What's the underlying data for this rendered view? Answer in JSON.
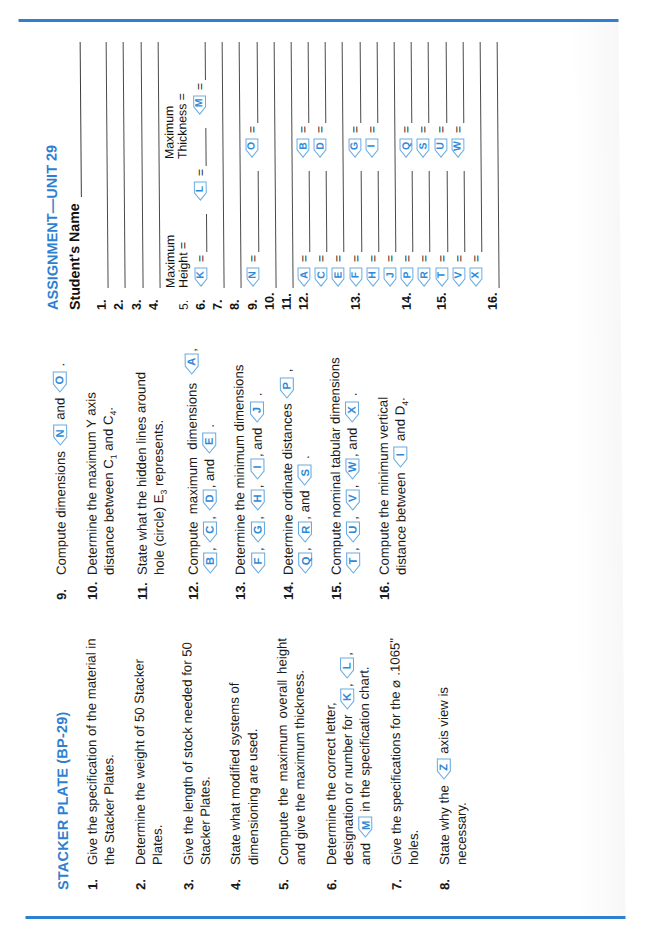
{
  "page": {
    "accent_color": "#2f7fd1",
    "balloon_color": "#2f8ad6",
    "section_title": "STACKER PLATE (BP-29)",
    "assignment_title": "ASSIGNMENT—UNIT 29",
    "student_name_label": "Student's Name"
  },
  "questions": [
    {
      "num": "1.",
      "text_parts": [
        {
          "t": "Give the specification of the material in the Stacker Plates."
        }
      ]
    },
    {
      "num": "2.",
      "text_parts": [
        {
          "t": "Determine the weight of 50 Stacker Plates."
        }
      ]
    },
    {
      "num": "3.",
      "text_parts": [
        {
          "t": "Give the length of stock needed for 50 Stacker Plates."
        }
      ]
    },
    {
      "num": "4.",
      "text_parts": [
        {
          "t": "State what modified systems of dimensioning are used."
        }
      ]
    },
    {
      "num": "5.",
      "text_parts": [
        {
          "t": "Compute the maximum overall height and give the maximum thickness."
        }
      ]
    },
    {
      "num": "6.",
      "text_parts": [
        {
          "t": "Determine the correct letter, designation or number for "
        },
        {
          "b": "K"
        },
        {
          "t": ", "
        },
        {
          "b": "L"
        },
        {
          "t": ", and "
        },
        {
          "b": "M"
        },
        {
          "t": " in the specification chart."
        }
      ]
    },
    {
      "num": "7.",
      "text_parts": [
        {
          "t": "Give the specifications for the ⌀ .1065\" holes."
        }
      ]
    },
    {
      "num": "8.",
      "text_parts": [
        {
          "t": "State why the "
        },
        {
          "b": "Z"
        },
        {
          "t": " axis view is necessary."
        }
      ]
    },
    {
      "num": "9.",
      "text_parts": [
        {
          "t": "Compute dimensions "
        },
        {
          "b": "N"
        },
        {
          "t": " and "
        },
        {
          "b": "O"
        },
        {
          "t": " ."
        }
      ]
    },
    {
      "num": "10.",
      "text_parts": [
        {
          "t": "Determine the maximum Y axis distance between C"
        },
        {
          "sub": "1"
        },
        {
          "t": " and C"
        },
        {
          "sub": "4"
        },
        {
          "t": "."
        }
      ]
    },
    {
      "num": "11.",
      "text_parts": [
        {
          "t": "State what the hidden lines around hole (circle) E"
        },
        {
          "sub": "3"
        },
        {
          "t": " represents."
        }
      ]
    },
    {
      "num": "12.",
      "text_parts": [
        {
          "t": "Compute maximum dimensions "
        },
        {
          "b": "A"
        },
        {
          "t": ", "
        },
        {
          "b": "B"
        },
        {
          "t": ", "
        },
        {
          "b": "C"
        },
        {
          "t": ", "
        },
        {
          "b": "D"
        },
        {
          "t": ", and "
        },
        {
          "b": "E"
        },
        {
          "t": " ."
        }
      ]
    },
    {
      "num": "13.",
      "text_parts": [
        {
          "t": "Determine the minimum dimensions "
        },
        {
          "b": "F"
        },
        {
          "t": ", "
        },
        {
          "b": "G"
        },
        {
          "t": ", "
        },
        {
          "b": "H"
        },
        {
          "t": ", "
        },
        {
          "b": "I"
        },
        {
          "t": ", and "
        },
        {
          "b": "J"
        },
        {
          "t": " ."
        }
      ]
    },
    {
      "num": "14.",
      "text_parts": [
        {
          "t": "Determine ordinate distances "
        },
        {
          "b": "P"
        },
        {
          "t": " , "
        },
        {
          "b": "Q"
        },
        {
          "t": ", "
        },
        {
          "b": "R"
        },
        {
          "t": ", and "
        },
        {
          "b": "S"
        },
        {
          "t": " ."
        }
      ]
    },
    {
      "num": "15.",
      "text_parts": [
        {
          "t": "Compute nominal tabular dimensions "
        },
        {
          "b": "T"
        },
        {
          "t": ", "
        },
        {
          "b": "U"
        },
        {
          "t": ", "
        },
        {
          "b": "V"
        },
        {
          "t": ", "
        },
        {
          "b": "W"
        },
        {
          "t": ", and "
        },
        {
          "b": "X"
        },
        {
          "t": " ."
        }
      ]
    },
    {
      "num": "16.",
      "text_parts": [
        {
          "t": "Compute the minimum vertical distance between "
        },
        {
          "b": "I"
        },
        {
          "t": " and D"
        },
        {
          "sub": "4"
        },
        {
          "t": "."
        }
      ]
    }
  ],
  "answer_sheet": {
    "title": "ASSIGNMENT—UNIT 29",
    "name_label": "Student's Name",
    "header_5": {
      "left": "Maximum\nHeight =",
      "right": "Maximum\nThickness ="
    },
    "rows": [
      {
        "num": "1.",
        "cells": [
          {
            "type": "line"
          }
        ]
      },
      {
        "num": "2.",
        "cells": [
          {
            "type": "line"
          }
        ]
      },
      {
        "num": "3.",
        "cells": [
          {
            "type": "line"
          }
        ]
      },
      {
        "num": "4.",
        "cells": [
          {
            "type": "line"
          }
        ]
      },
      {
        "num": "5.",
        "cells": [
          {
            "type": "header-height"
          },
          {
            "type": "header-thickness"
          }
        ]
      },
      {
        "num": "6.",
        "cells": [
          {
            "type": "balloon",
            "label": "K",
            "eq": "="
          },
          {
            "type": "balloon",
            "label": "L",
            "eq": "="
          },
          {
            "type": "balloon",
            "label": "M",
            "eq": "="
          }
        ]
      },
      {
        "num": "7.",
        "cells": [
          {
            "type": "line"
          }
        ]
      },
      {
        "num": "8.",
        "cells": [
          {
            "type": "line"
          }
        ]
      },
      {
        "num": "9.",
        "cells": [
          {
            "type": "balloon",
            "label": "N",
            "eq": "="
          },
          {
            "type": "balloon",
            "label": "O",
            "eq": "="
          }
        ]
      },
      {
        "num": "10.",
        "cells": [
          {
            "type": "line"
          }
        ]
      },
      {
        "num": "11.",
        "cells": [
          {
            "type": "line"
          }
        ]
      },
      {
        "num": "12.",
        "cells": [
          {
            "type": "balloon",
            "label": "A",
            "eq": "="
          },
          {
            "type": "balloon",
            "label": "B",
            "eq": "="
          }
        ]
      },
      {
        "num": "",
        "cells": [
          {
            "type": "balloon",
            "label": "C",
            "eq": "="
          },
          {
            "type": "balloon",
            "label": "D",
            "eq": "="
          }
        ]
      },
      {
        "num": "",
        "cells": [
          {
            "type": "balloon",
            "label": "E",
            "eq": "="
          }
        ]
      },
      {
        "num": "13.",
        "cells": [
          {
            "type": "balloon",
            "label": "F",
            "eq": "="
          },
          {
            "type": "balloon",
            "label": "G",
            "eq": "="
          }
        ]
      },
      {
        "num": "",
        "cells": [
          {
            "type": "balloon",
            "label": "H",
            "eq": "="
          },
          {
            "type": "balloon",
            "label": "I",
            "eq": "="
          }
        ]
      },
      {
        "num": "",
        "cells": [
          {
            "type": "balloon",
            "label": "J",
            "eq": "="
          }
        ]
      },
      {
        "num": "14.",
        "cells": [
          {
            "type": "balloon",
            "label": "P",
            "eq": "="
          },
          {
            "type": "balloon",
            "label": "Q",
            "eq": "="
          }
        ]
      },
      {
        "num": "",
        "cells": [
          {
            "type": "balloon",
            "label": "R",
            "eq": "="
          },
          {
            "type": "balloon",
            "label": "S",
            "eq": "="
          }
        ]
      },
      {
        "num": "15.",
        "cells": [
          {
            "type": "balloon",
            "label": "T",
            "eq": "="
          },
          {
            "type": "balloon",
            "label": "U",
            "eq": "="
          }
        ]
      },
      {
        "num": "",
        "cells": [
          {
            "type": "balloon",
            "label": "V",
            "eq": "="
          },
          {
            "type": "balloon",
            "label": "W",
            "eq": "="
          }
        ]
      },
      {
        "num": "",
        "cells": [
          {
            "type": "balloon",
            "label": "X",
            "eq": "="
          }
        ]
      },
      {
        "num": "16.",
        "cells": [
          {
            "type": "line"
          }
        ]
      }
    ]
  }
}
